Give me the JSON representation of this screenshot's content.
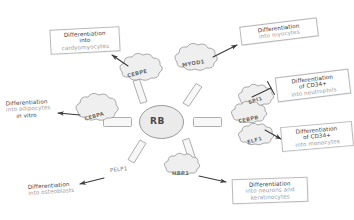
{
  "diagram": {
    "hub": {
      "label": "RB",
      "name": "rb-hub"
    },
    "colors": {
      "stroke": "#8f8f8f",
      "cloud_fill": "#f0f0f0",
      "hub_fill": "#ebebeb",
      "text_dark": "#3a3a3a",
      "text_muted": "#9a9a9a",
      "box_border": "#b9b9b9",
      "background": "#ffffff"
    },
    "genes": [
      {
        "id": "cebpe",
        "label": "CEBPE",
        "shape": "cloud"
      },
      {
        "id": "myod1",
        "label": "MYOD1",
        "shape": "cloud"
      },
      {
        "id": "spi1",
        "label": "SPI1",
        "shape": "cloud"
      },
      {
        "id": "elf1",
        "label": "ELF1",
        "shape": "cloud"
      },
      {
        "id": "cebpb",
        "label": "CEBPB",
        "shape": "cloud"
      },
      {
        "id": "hbp1",
        "label": "HBP1",
        "shape": "cloud"
      },
      {
        "id": "pelp1",
        "label": "PELP1",
        "shape": "plain"
      },
      {
        "id": "cebpa",
        "label": "CEBPA",
        "shape": "cloud"
      }
    ],
    "outcomes": [
      {
        "id": "cardyomyocytes",
        "style": "box",
        "lines": [
          {
            "text": "Differentiation",
            "muted": false
          },
          {
            "text": "into",
            "muted": false
          },
          {
            "text": "cardyomyocytes",
            "muted": true
          }
        ],
        "from": "cebpe",
        "edge": "activation"
      },
      {
        "id": "myocytes",
        "style": "box",
        "lines": [
          {
            "text": "Differentiation",
            "muted": false
          },
          {
            "text": "into myocytes",
            "muted": true
          }
        ],
        "from": "myod1",
        "edge": "activation"
      },
      {
        "id": "neutrophils",
        "style": "box",
        "lines": [
          {
            "text": "Differentiation",
            "muted": false
          },
          {
            "text": "of CD34+",
            "muted": false
          },
          {
            "text": "into neutrophils",
            "muted": true
          }
        ],
        "from": "spi1",
        "edge": "inhibition"
      },
      {
        "id": "monocytes",
        "style": "box",
        "lines": [
          {
            "text": "Differentiation",
            "muted": false
          },
          {
            "text": "of CD34+",
            "muted": false
          },
          {
            "text": "into monocytes",
            "muted": true
          }
        ],
        "from": "cebpb",
        "edge": "activation"
      },
      {
        "id": "neurons-keratinocytes",
        "style": "box",
        "lines": [
          {
            "text": "Differentiation",
            "muted": false
          },
          {
            "text": "into neurons and",
            "muted": true
          },
          {
            "text": "keratinocytes",
            "muted": true
          }
        ],
        "from": "hbp1",
        "edge": "activation"
      },
      {
        "id": "osteoblasts",
        "style": "plain",
        "lines": [
          {
            "text": "Differentiation",
            "muted": false
          },
          {
            "text": "into osteoblasts",
            "muted": true
          }
        ],
        "from": "pelp1",
        "edge": "activation"
      },
      {
        "id": "adipocytes",
        "style": "plain",
        "lines": [
          {
            "text": "Differentiation",
            "muted": false
          },
          {
            "text": "into adipocytes",
            "muted": true
          },
          {
            "text": "in vitro",
            "muted": false
          }
        ],
        "from": "cebpa",
        "edge": "activation"
      }
    ]
  }
}
